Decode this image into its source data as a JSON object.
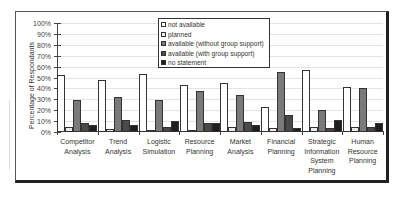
{
  "chart_data": {
    "type": "bar",
    "title": "",
    "xlabel": "",
    "ylabel": "Percentage of Respondants",
    "ylim": [
      0,
      100
    ],
    "yticks": [
      "0%",
      "10%",
      "20%",
      "30%",
      "40%",
      "50%",
      "60%",
      "70%",
      "80%",
      "90%",
      "100%"
    ],
    "grid": true,
    "legend_position": "top-center (inside plot)",
    "categories": [
      [
        "Competitor",
        "Analysis"
      ],
      [
        "Trend",
        "Analysis"
      ],
      [
        "Logistic",
        "Simulation"
      ],
      [
        "Resource",
        "Planning"
      ],
      [
        "Market",
        "Analysis"
      ],
      [
        "Financial",
        "Planning"
      ],
      [
        "Strategic",
        "Information",
        "System",
        "Planning"
      ],
      [
        "Human",
        "Resource",
        "Planning"
      ]
    ],
    "series": [
      {
        "name": "not available",
        "color": "#ffffff",
        "values": [
          52,
          48,
          53,
          43,
          45,
          23,
          57,
          41
        ]
      },
      {
        "name": "planned",
        "color": "#ececec",
        "values": [
          5,
          3,
          2,
          2,
          5,
          4,
          5,
          5
        ]
      },
      {
        "name": "available (without group support)",
        "color": "#7a7a7a",
        "values": [
          29,
          32,
          29,
          38,
          34,
          55,
          20,
          40
        ]
      },
      {
        "name": "available (with group support)",
        "color": "#4a4a4a",
        "values": [
          8,
          11,
          5,
          8,
          9,
          16,
          4,
          5
        ]
      },
      {
        "name": "no statement",
        "color": "#1e1e1e",
        "values": [
          6,
          6,
          10,
          8,
          6,
          4,
          11,
          8
        ]
      }
    ]
  }
}
